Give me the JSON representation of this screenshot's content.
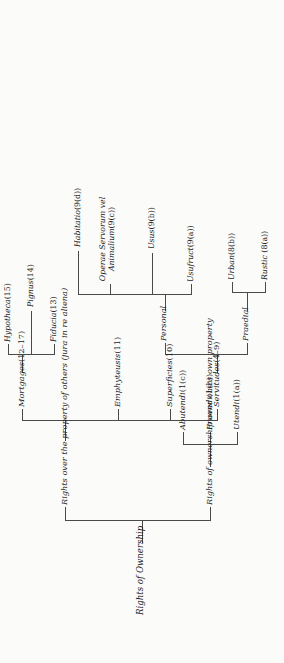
{
  "diagram": {
    "title": "Rights of Ownership",
    "type": "hierarchical-tree",
    "orientation": "rotated-90-ccw",
    "ink_color": "#1a1a1a",
    "line_color": "#4a4a4a",
    "page_color": "#fbfbf9"
  },
  "nodes": {
    "root": {
      "label": "Rights of Ownership"
    },
    "own_property": {
      "label": "Rights of ownership over one's own property"
    },
    "others_property": {
      "label": "Rights over the property of others (jura in re aliena)"
    },
    "utendi": {
      "label": "Utendi",
      "ref": "(1(a))"
    },
    "fruendi": {
      "label": "Fruendi",
      "ref": "(1(b))"
    },
    "abutendi": {
      "label": "Abutendi",
      "ref": "(1(c))"
    },
    "servitudes": {
      "label": "Servitudes",
      "ref": "(4–9)"
    },
    "superficies": {
      "label": "Superficies",
      "ref": "(10)"
    },
    "emphyteusis": {
      "label": "Emphyteusis",
      "ref": "(11)"
    },
    "mortgages": {
      "label": "Mortgages",
      "ref": "(12–17)"
    },
    "praedial": {
      "label": "Praedial"
    },
    "personal": {
      "label": "Personal"
    },
    "rustic": {
      "label": "Rustic ",
      "ref": "(8(a))"
    },
    "urban": {
      "label": "Urban",
      "ref": "(8(b))"
    },
    "usufruct": {
      "label": "Usufruct",
      "ref": "(9(a))"
    },
    "usus": {
      "label": "Usus",
      "ref": "(9(b))"
    },
    "operae": {
      "label": "Operae Servorum vel Animalium",
      "ref": "(9(c))"
    },
    "habitatio": {
      "label": "Habitatio",
      "ref": "(9(d))"
    },
    "fiducia": {
      "label": "Fiducia",
      "ref": "(13)"
    },
    "pignus": {
      "label": "Pignus",
      "ref": "(14)"
    },
    "hypotheca": {
      "label": "Hypotheca",
      "ref": "(15)"
    }
  }
}
